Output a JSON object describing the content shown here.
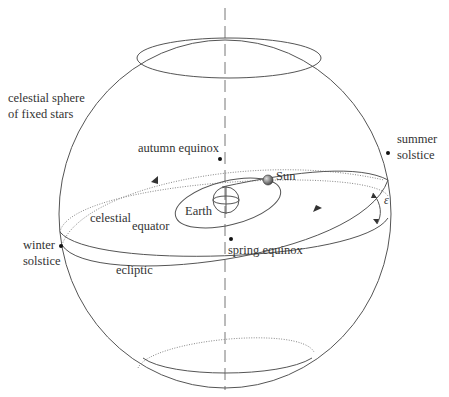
{
  "diagram": {
    "labels": {
      "sphere": [
        "celestial sphere",
        "of fixed stars"
      ],
      "autumn_equinox": "autumn equinox",
      "sun": "Sun",
      "earth": "Earth",
      "summer_solstice": [
        "summer",
        "solstice"
      ],
      "celestial_equator": [
        "celestial",
        "equator"
      ],
      "winter_solstice": [
        "winter",
        "solstice"
      ],
      "spring_equinox": "spring equinox",
      "ecliptic": "ecliptic",
      "obliquity_symbol": "ε"
    },
    "colors": {
      "line": "#555555",
      "dotted": "#888888",
      "text": "#333333",
      "sun": "#666666"
    }
  }
}
